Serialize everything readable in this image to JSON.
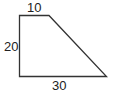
{
  "diagram": {
    "shape": "right trapezoid",
    "labels": {
      "top": "10",
      "left": "20",
      "bottom": "30"
    },
    "stroke_color": "#333333"
  }
}
